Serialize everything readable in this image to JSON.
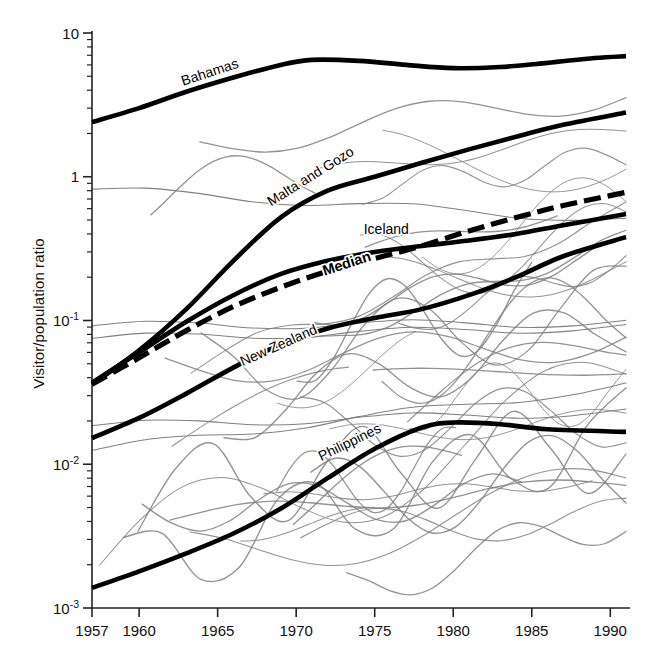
{
  "figure": {
    "title": "",
    "ylabel": "Visitor/population ratio",
    "xlabel": "",
    "background": "#ffffff",
    "highlight_color": "#000000",
    "background_series_color": "#808080"
  },
  "axes": {
    "x_ticks": [
      "1957",
      "1960",
      "1965",
      "1970",
      "1975",
      "1980",
      "1985",
      "1990"
    ],
    "x_tick_values": [
      1957,
      1960,
      1965,
      1970,
      1975,
      1980,
      1985,
      1990
    ],
    "y_ticks": [
      "10",
      "1",
      "10-1",
      "10-2",
      "10-3"
    ],
    "y_tick_bases": [
      "10",
      "1",
      "10",
      "10",
      "10"
    ],
    "y_tick_exponents": [
      "",
      "",
      "-1",
      "-2",
      "-3"
    ],
    "y_tick_values": [
      10,
      1,
      0.1,
      0.01,
      0.001
    ],
    "xlim": [
      1957,
      1991
    ],
    "ylim": [
      0.001,
      10
    ],
    "yscale": "log",
    "grid": "off",
    "minor_ticks": "on"
  },
  "chart_data": {
    "type": "line",
    "title": "",
    "xlabel": "",
    "ylabel": "Visitor/population ratio",
    "yscale": "log",
    "xlim": [
      1957,
      1991
    ],
    "ylim": [
      0.001,
      10
    ],
    "grid": "off",
    "legend": "inline-labels",
    "highlighted_series": [
      {
        "name": "Bahamas",
        "style": "solid-black-thick",
        "label_x": 1962.8,
        "label_y": 4.3,
        "label_rotation": -18,
        "x": [
          1957,
          1960,
          1963,
          1966,
          1969,
          1971,
          1974,
          1977,
          1980,
          1983,
          1986,
          1989,
          1991
        ],
        "y": [
          2.4,
          3.0,
          3.9,
          4.9,
          6.0,
          6.5,
          6.4,
          6.0,
          5.7,
          5.8,
          6.2,
          6.7,
          6.9
        ]
      },
      {
        "name": "Malta and Gozo",
        "style": "solid-black-thick",
        "label_x": 1968.4,
        "label_y": 0.62,
        "label_rotation": -32,
        "x": [
          1957,
          1960,
          1963,
          1966,
          1969,
          1972,
          1975,
          1978,
          1981,
          1984,
          1987,
          1991
        ],
        "y": [
          0.036,
          0.062,
          0.12,
          0.26,
          0.52,
          0.8,
          1.0,
          1.25,
          1.55,
          1.9,
          2.3,
          2.8
        ]
      },
      {
        "name": "Iceland",
        "style": "solid-black-thick",
        "label_x": 1974.3,
        "label_y": 0.4,
        "label_rotation": 0,
        "x": [
          1957,
          1960,
          1963,
          1966,
          1969,
          1972,
          1975,
          1978,
          1981,
          1984,
          1987,
          1991
        ],
        "y": [
          0.037,
          0.06,
          0.098,
          0.15,
          0.21,
          0.26,
          0.3,
          0.33,
          0.36,
          0.4,
          0.46,
          0.55
        ]
      },
      {
        "name": "Median",
        "style": "dashed-black-thick",
        "label_x": 1971.8,
        "label_y": 0.205,
        "label_rotation": -18,
        "x": [
          1957,
          1960,
          1963,
          1966,
          1969,
          1972,
          1975,
          1978,
          1981,
          1984,
          1987,
          1991
        ],
        "y": [
          0.036,
          0.055,
          0.085,
          0.125,
          0.17,
          0.22,
          0.27,
          0.33,
          0.42,
          0.52,
          0.63,
          0.78
        ]
      },
      {
        "name": "New Zealand",
        "style": "solid-black-thick",
        "label_x": 1966.6,
        "label_y": 0.048,
        "label_rotation": -24,
        "x": [
          1957,
          1960,
          1963,
          1966,
          1969,
          1972,
          1975,
          1978,
          1981,
          1984,
          1987,
          1991
        ],
        "y": [
          0.0152,
          0.021,
          0.031,
          0.047,
          0.068,
          0.088,
          0.104,
          0.12,
          0.15,
          0.2,
          0.28,
          0.38
        ]
      },
      {
        "name": "Philippines",
        "style": "solid-black-thick",
        "label_x": 1971.6,
        "label_y": 0.0105,
        "label_rotation": -26,
        "x": [
          1957,
          1960,
          1963,
          1966,
          1969,
          1972,
          1975,
          1978,
          1980,
          1983,
          1986,
          1991
        ],
        "y": [
          0.00138,
          0.0018,
          0.0024,
          0.0033,
          0.0049,
          0.008,
          0.0128,
          0.018,
          0.0195,
          0.019,
          0.0175,
          0.0168
        ]
      }
    ],
    "background_series_count": 38,
    "background_series_note": "Unlabeled grey comparison-country trajectories"
  }
}
